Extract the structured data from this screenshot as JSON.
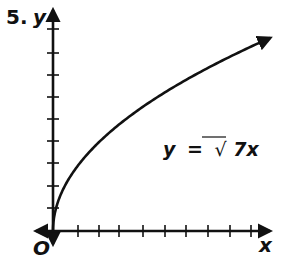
{
  "problem_number": "5.",
  "axes": {
    "x_label": "x",
    "y_label": "y",
    "origin_label": "O"
  },
  "equation": {
    "lhs": "y",
    "eq": "=",
    "radical": "√",
    "radicand": "7x"
  },
  "colors": {
    "ink": "#111111",
    "background": "#ffffff"
  },
  "chart_data": {
    "type": "line",
    "title": "",
    "function": "y = sqrt(7x)",
    "xlabel": "x",
    "ylabel": "y",
    "x_ticks_count": 9,
    "y_ticks_count": 9,
    "tick_labels_shown": false,
    "grid": false,
    "xlim": [
      0,
      10
    ],
    "ylim": [
      0,
      9.5
    ],
    "x": [
      0,
      0.25,
      0.5,
      1,
      2,
      3,
      4,
      5,
      6,
      7,
      8,
      9,
      10
    ],
    "y": [
      0,
      1.32,
      1.87,
      2.65,
      3.74,
      4.58,
      5.29,
      5.92,
      6.48,
      7.0,
      7.48,
      7.94,
      8.37
    ],
    "annotations": [
      {
        "text": "y = √7x",
        "position": "right of curve, mid-height"
      }
    ],
    "curve_end_arrow": true
  }
}
